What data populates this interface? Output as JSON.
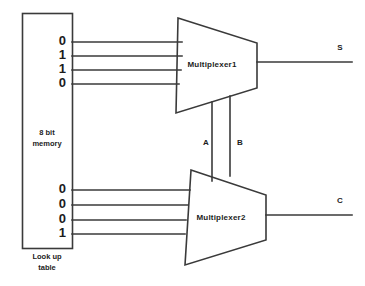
{
  "diagram": {
    "stroke_color": "#3a3a3a",
    "text_color": "#1c1c1c",
    "background": "#ffffff",
    "memory": {
      "label_line1": "8 bit",
      "label_line2": "memory",
      "caption_line1": "Look up",
      "caption_line2": "table",
      "top_bits": [
        "0",
        "1",
        "1",
        "0"
      ],
      "bottom_bits": [
        "0",
        "0",
        "0",
        "1"
      ]
    },
    "multiplexers": [
      {
        "name": "mux1",
        "label": "Multiplexer1"
      },
      {
        "name": "mux2",
        "label": "Multiplexer2"
      }
    ],
    "control_lines": [
      {
        "name": "control-a",
        "label": "A"
      },
      {
        "name": "control-b",
        "label": "B"
      }
    ],
    "outputs": [
      {
        "name": "output-s",
        "label": "S"
      },
      {
        "name": "output-c",
        "label": "C"
      }
    ]
  }
}
